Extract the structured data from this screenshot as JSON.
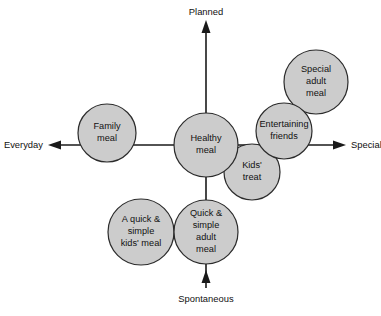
{
  "diagram": {
    "type": "bubble-positioning-map",
    "background_color": "#ffffff",
    "bubble_fill": "#cccccc",
    "bubble_stroke": "#2b2b2b",
    "axis_color": "#1a1a1a",
    "axes": {
      "vertical": {
        "top_label": "Planned",
        "bottom_label": "Spontaneous"
      },
      "horizontal": {
        "left_label": "Everyday",
        "right_label": "Special"
      }
    },
    "bubbles": [
      {
        "id": "healthy-meal",
        "lines": [
          "Healthy",
          "meal"
        ],
        "cx": 206,
        "cy": 145,
        "r": 32
      },
      {
        "id": "family-meal",
        "lines": [
          "Family",
          "meal"
        ],
        "cx": 107,
        "cy": 133,
        "r": 29
      },
      {
        "id": "kids-treat",
        "lines": [
          "Kids'",
          "treat"
        ],
        "cx": 252,
        "cy": 172,
        "r": 28
      },
      {
        "id": "entertaining-friends",
        "lines": [
          "Entertaining",
          "friends"
        ],
        "cx": 284,
        "cy": 131,
        "r": 28
      },
      {
        "id": "special-adult-meal",
        "lines": [
          "Special",
          "adult",
          "meal"
        ],
        "cx": 316,
        "cy": 82,
        "r": 32
      },
      {
        "id": "quick-simple-kids-meal",
        "lines": [
          "A quick &",
          "simple",
          "kids' meal"
        ],
        "cx": 141,
        "cy": 232,
        "r": 33
      },
      {
        "id": "quick-simple-adult-meal",
        "lines": [
          "Quick &",
          "simple",
          "adult",
          "meal"
        ],
        "cx": 206,
        "cy": 232,
        "r": 32
      }
    ]
  }
}
